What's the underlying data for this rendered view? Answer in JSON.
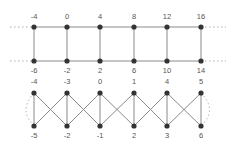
{
  "diagram": {
    "graph_top": {
      "x_positions": [
        34,
        67,
        100,
        134,
        167,
        201
      ],
      "upper_row": {
        "y": 27,
        "labels": [
          "-4",
          "0",
          "4",
          "8",
          "12",
          "16"
        ]
      },
      "lower_row": {
        "y": 61,
        "labels": [
          "-6",
          "-2",
          "2",
          "6",
          "10",
          "14"
        ]
      },
      "structure": "ladder (two horizontal paths joined by vertical rungs), continues beyond both ends (dashed)"
    },
    "graph_bottom": {
      "x_positions": [
        34,
        67,
        100,
        134,
        167,
        201
      ],
      "upper_row": {
        "y": 93,
        "labels": [
          "-4",
          "-3",
          "0",
          "1",
          "4",
          "5"
        ]
      },
      "lower_row": {
        "y": 126,
        "labels": [
          "-5",
          "-2",
          "-1",
          "2",
          "3",
          "6"
        ]
      },
      "structure": "vertical rungs plus crossing diagonals between adjacent columns; dotted curved edges at ends"
    },
    "colors": {
      "node": "#333333",
      "edge": "#8a8a8a",
      "label": "#555555"
    }
  }
}
